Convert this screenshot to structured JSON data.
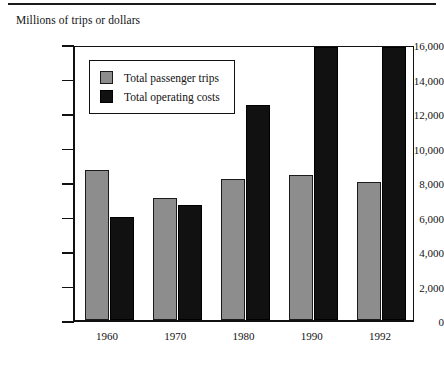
{
  "chart_data": {
    "type": "bar",
    "title": "",
    "ylabel": "Millions of trips or dollars",
    "xlabel": "",
    "categories": [
      "1960",
      "1970",
      "1980",
      "1990",
      "1992"
    ],
    "series": [
      {
        "name": "Total passenger trips",
        "color": "#8d8d8d",
        "values": [
          8700,
          7100,
          8200,
          8400,
          8000
        ]
      },
      {
        "name": "Total operating costs",
        "color": "#111111",
        "values": [
          6000,
          6650,
          12450,
          15850,
          15850
        ]
      }
    ],
    "ylim": [
      0,
      16000
    ],
    "yticks": [
      0,
      2000,
      4000,
      6000,
      8000,
      10000,
      12000,
      14000,
      16000
    ],
    "ytick_labels": [
      "0",
      "2,000",
      "4,000",
      "6,000",
      "8,000",
      "10,000",
      "12,000",
      "14,000",
      "16,000"
    ],
    "grid": false,
    "legend_position": "upper left inside"
  },
  "legend": {
    "items": [
      {
        "label": "Total passenger trips",
        "swatch": "gray-swatch-icon"
      },
      {
        "label": "Total operating costs",
        "swatch": "black-swatch-icon"
      }
    ]
  }
}
